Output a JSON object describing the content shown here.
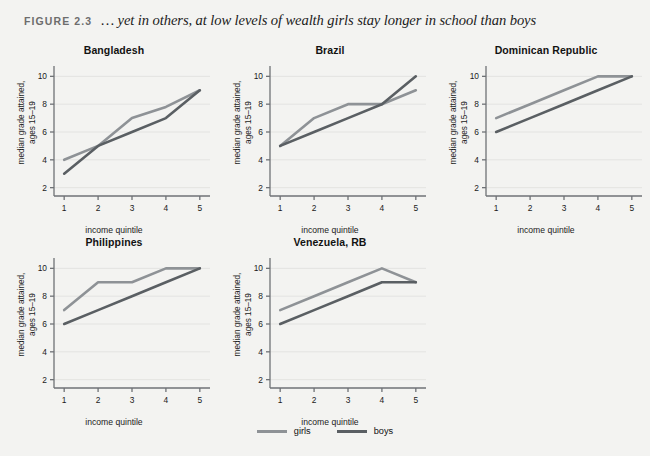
{
  "figure": {
    "number": "FIGURE 2.3",
    "title": "… yet in others, at low levels of wealth girls stay longer in school than boys"
  },
  "axes": {
    "xlabel": "income quintile",
    "ylabel_line1": "median grade attained,",
    "ylabel_line2": "ages 15–19",
    "xticks": [
      "1",
      "2",
      "3",
      "4",
      "5"
    ],
    "yticks": [
      "2",
      "4",
      "6",
      "8",
      "10"
    ]
  },
  "legend": {
    "position": "bottom-center",
    "items": [
      {
        "label": "girls",
        "color": "#8e9296"
      },
      {
        "label": "boys",
        "color": "#5a5f63"
      }
    ]
  },
  "colors": {
    "girls": "#8e9296",
    "boys": "#5a5f63",
    "background": "#f3f3f1",
    "axis": "#6f7276",
    "grid": "#e3e3e1"
  },
  "chart_data": [
    {
      "type": "line",
      "title": "Bangladesh",
      "xlabel": "income quintile",
      "ylabel": "median grade attained, ages 15–19",
      "x": [
        1,
        2,
        3,
        4,
        5
      ],
      "categories": [
        "1",
        "2",
        "3",
        "4",
        "5"
      ],
      "xlim": [
        0.7,
        5.3
      ],
      "ylim": [
        1.4,
        10.6
      ],
      "grid": true,
      "series": [
        {
          "name": "girls",
          "values": [
            4,
            5,
            7,
            7.8,
            9
          ]
        },
        {
          "name": "boys",
          "values": [
            3,
            5,
            6,
            7,
            9
          ]
        }
      ]
    },
    {
      "type": "line",
      "title": "Brazil",
      "xlabel": "income quintile",
      "ylabel": "median grade attained, ages 15–19",
      "x": [
        1,
        2,
        3,
        4,
        5
      ],
      "categories": [
        "1",
        "2",
        "3",
        "4",
        "5"
      ],
      "xlim": [
        0.7,
        5.3
      ],
      "ylim": [
        1.4,
        10.6
      ],
      "grid": true,
      "series": [
        {
          "name": "girls",
          "values": [
            5,
            7,
            8,
            8,
            9
          ]
        },
        {
          "name": "boys",
          "values": [
            5,
            6,
            7,
            8,
            10
          ]
        }
      ]
    },
    {
      "type": "line",
      "title": "Dominican Republic",
      "xlabel": "income quintile",
      "ylabel": "median grade attained, ages 15–19",
      "x": [
        1,
        2,
        3,
        4,
        5
      ],
      "categories": [
        "1",
        "2",
        "3",
        "4",
        "5"
      ],
      "xlim": [
        0.7,
        5.3
      ],
      "ylim": [
        1.4,
        10.6
      ],
      "grid": true,
      "series": [
        {
          "name": "girls",
          "values": [
            7,
            8,
            9,
            10,
            10
          ]
        },
        {
          "name": "boys",
          "values": [
            6,
            7,
            8,
            9,
            10
          ]
        }
      ]
    },
    {
      "type": "line",
      "title": "Philippines",
      "xlabel": "income quintile",
      "ylabel": "median grade attained, ages 15–19",
      "x": [
        1,
        2,
        3,
        4,
        5
      ],
      "categories": [
        "1",
        "2",
        "3",
        "4",
        "5"
      ],
      "xlim": [
        0.7,
        5.3
      ],
      "ylim": [
        1.4,
        10.6
      ],
      "grid": true,
      "series": [
        {
          "name": "girls",
          "values": [
            7,
            9,
            9,
            10,
            10
          ]
        },
        {
          "name": "boys",
          "values": [
            6,
            7,
            8,
            9,
            10
          ]
        }
      ]
    },
    {
      "type": "line",
      "title": "Venezuela, RB",
      "xlabel": "income quintile",
      "ylabel": "median grade attained, ages 15–19",
      "x": [
        1,
        2,
        3,
        4,
        5
      ],
      "categories": [
        "1",
        "2",
        "3",
        "4",
        "5"
      ],
      "xlim": [
        0.7,
        5.3
      ],
      "ylim": [
        1.4,
        10.6
      ],
      "grid": true,
      "series": [
        {
          "name": "girls",
          "values": [
            7,
            8,
            9,
            10,
            9
          ]
        },
        {
          "name": "boys",
          "values": [
            6,
            7,
            8,
            9,
            9
          ]
        }
      ]
    }
  ]
}
